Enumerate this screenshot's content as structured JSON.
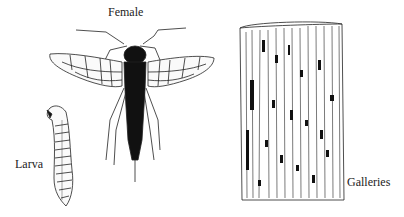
{
  "figure": {
    "labels": {
      "female": "Female",
      "larva": "Larva",
      "galleries": "Galleries"
    },
    "subjects": [
      "female-insect",
      "larva",
      "wood-log-with-galleries"
    ]
  }
}
